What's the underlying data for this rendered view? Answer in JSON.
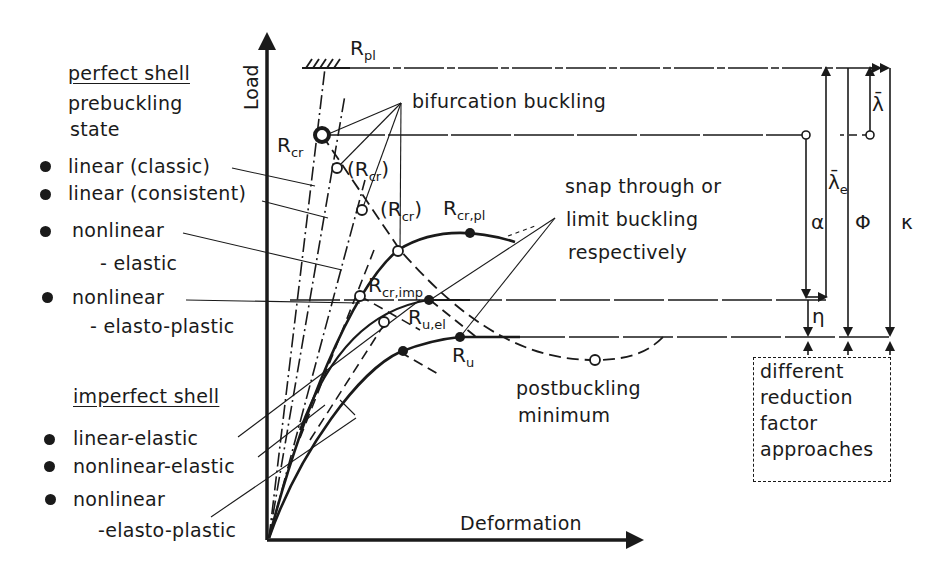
{
  "axes": {
    "y_label": "Load",
    "x_label": "Deformation"
  },
  "left_legend": {
    "perfect_shell": {
      "heading": "perfect shell",
      "subheading_line1": "prebuckling",
      "subheading_line2": "state",
      "items": [
        {
          "line1": "linear (classic)",
          "line2": ""
        },
        {
          "line1": "linear (consistent)",
          "line2": ""
        },
        {
          "line1": "nonlinear",
          "line2": "- elastic"
        },
        {
          "line1": "nonlinear",
          "line2": "- elasto-plastic"
        }
      ]
    },
    "imperfect_shell": {
      "heading": "imperfect shell",
      "items": [
        {
          "line1": "linear-elastic",
          "line2": ""
        },
        {
          "line1": "nonlinear-elastic",
          "line2": ""
        },
        {
          "line1": "nonlinear",
          "line2": "-elasto-plastic"
        }
      ]
    }
  },
  "annotations": {
    "bifurcation": "bifurcation buckling",
    "snap_line1": "snap through or",
    "snap_line2": "limit buckling",
    "snap_line3": "respectively",
    "postbuckling_line1": "postbuckling",
    "postbuckling_line2": "minimum"
  },
  "points": {
    "R_pl": {
      "base": "R",
      "sub": "pl"
    },
    "R_cr": {
      "base": "R",
      "sub": "cr"
    },
    "R_cr_paren1": {
      "base": "(R",
      "sub": "cr",
      "tail": ")"
    },
    "R_cr_paren2": {
      "base": "(R",
      "sub": "cr",
      "tail": ")"
    },
    "R_cr_pl": {
      "base": "R",
      "sub": "cr,pl"
    },
    "R_cr_imp": {
      "base": "R",
      "sub": "cr,imp"
    },
    "R_u_el": {
      "base": "R",
      "sub": "u,el"
    },
    "R_u": {
      "base": "R",
      "sub": "u"
    }
  },
  "reduction_factors": {
    "lambda_bar": "λ̄",
    "lambda_bar_e": {
      "base": "λ̄",
      "sub": "e"
    },
    "alpha": "α",
    "phi": "Φ",
    "kappa": "κ",
    "eta": "η"
  },
  "box": {
    "line1": "different",
    "line2": "reduction",
    "line3": "factor",
    "line4": "approaches"
  }
}
